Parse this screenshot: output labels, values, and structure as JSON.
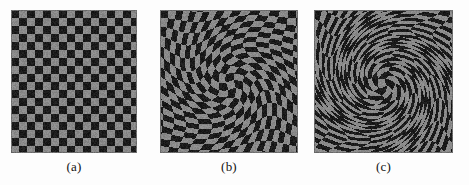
{
  "figure": {
    "kind": "checkerboard-swirl-distortion-comparison",
    "background_color": "#fdfdfd",
    "panel_count": 3
  },
  "colors": {
    "dark_square": "#1b1b1b",
    "light_square": "#8a8a8a",
    "border": "#6e6e6e",
    "caption_text": "#121212",
    "page_background": "#fdfdfd"
  },
  "checkerboard": {
    "cell_size_px": 8,
    "columns": 16,
    "rows": 18,
    "noise_amount": 0.1
  },
  "panels": [
    {
      "id": "a",
      "caption": "(a)",
      "label": "undistorted checkerboard",
      "x": 11,
      "y": 10,
      "width": 126,
      "height": 143,
      "swirl_strength": 0.0,
      "swirl_radius": 0,
      "center_x": 0.5,
      "center_y": 0.5
    },
    {
      "id": "b",
      "caption": "(b)",
      "label": "moderate swirl distortion",
      "x": 160,
      "y": 10,
      "width": 138,
      "height": 143,
      "swirl_strength": 2.1,
      "swirl_radius": 0.95,
      "center_x": 0.5,
      "center_y": 0.52
    },
    {
      "id": "c",
      "caption": "(c)",
      "label": "strong swirl distortion",
      "x": 314,
      "y": 10,
      "width": 139,
      "height": 143,
      "swirl_strength": 5.4,
      "swirl_radius": 1.0,
      "center_x": 0.5,
      "center_y": 0.52
    }
  ],
  "captions": {
    "a": "(a)",
    "b": "(b)",
    "c": "(c)"
  }
}
